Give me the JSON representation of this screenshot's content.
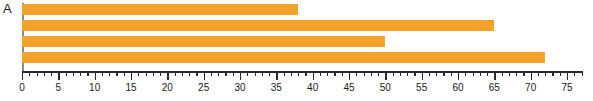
{
  "panel": {
    "label": "A"
  },
  "colors": {
    "bar": "#f4a22c",
    "axis": "#2b2b2b",
    "spine": "#8c8c8c",
    "background": "#ffffff",
    "text": "#1a1a1a"
  },
  "chart_data": {
    "type": "bar",
    "orientation": "horizontal",
    "title": "",
    "subtitle": "",
    "xlabel": "",
    "ylabel": "",
    "categories": [
      "bar-1",
      "bar-2",
      "bar-3",
      "bar-4"
    ],
    "values": [
      38,
      65,
      50,
      72
    ],
    "series": [
      {
        "name": "A",
        "values": [
          38,
          65,
          50,
          72
        ],
        "color": "#f4a22c"
      }
    ],
    "xlim": [
      0,
      77
    ],
    "ylim": [
      0,
      4
    ],
    "grid": false,
    "legend": false,
    "legend_position": "none",
    "x_tick_labels": [
      "0",
      "5",
      "10",
      "15",
      "20",
      "25",
      "30",
      "35",
      "40",
      "45",
      "50",
      "55",
      "60",
      "65",
      "70",
      "75"
    ],
    "x_major_ticks": [
      0,
      5,
      10,
      15,
      20,
      25,
      30,
      35,
      40,
      45,
      50,
      55,
      60,
      65,
      70,
      75
    ],
    "x_minor_tick_step": 1,
    "y_tick_labels": [],
    "annotations": [
      "A"
    ]
  }
}
